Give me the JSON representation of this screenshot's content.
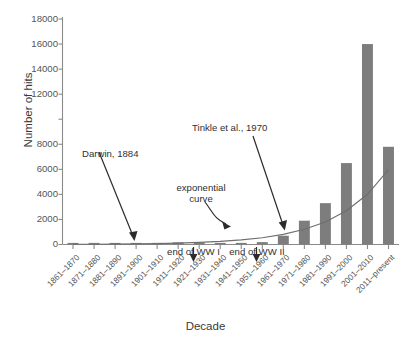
{
  "chart_data": {
    "type": "bar",
    "title": "",
    "subtitle": "",
    "xlabel": "Decade",
    "ylabel": "Number of hits",
    "ylim": [
      0,
      18000
    ],
    "ytick_labels": [
      "18000",
      "16000",
      "14000",
      "12000",
      "",
      "8000",
      "6000",
      "4000",
      "2000",
      "0"
    ],
    "ytick_values": [
      18000,
      16000,
      14000,
      12000,
      10000,
      8000,
      6000,
      4000,
      2000,
      0
    ],
    "grid": false,
    "legend": "none",
    "bar_color": "#7d7d7d",
    "curve_color": "#6e6e6e",
    "axis_color": "#8a8a8a",
    "categories": [
      "1861–1870",
      "1871–1880",
      "1881–1890",
      "1891–1900",
      "1901–1910",
      "1911–1920",
      "1921–1930",
      "1931–1940",
      "1941–1950",
      "1951–1960",
      "1961–1970",
      "1971–1980",
      "1981–1990",
      "1991–2000",
      "2001–2010",
      "2011–present"
    ],
    "values": [
      10,
      20,
      30,
      60,
      130,
      170,
      150,
      80,
      90,
      190,
      700,
      1900,
      3300,
      6500,
      16000,
      7800
    ],
    "series": [
      {
        "name": "Number of hits",
        "type": "bar",
        "values": [
          10,
          20,
          30,
          60,
          130,
          170,
          150,
          80,
          90,
          190,
          700,
          1900,
          3300,
          6500,
          16000,
          7800
        ]
      },
      {
        "name": "exponential curve",
        "type": "line",
        "values": [
          15,
          22,
          33,
          50,
          74,
          110,
          165,
          245,
          365,
          545,
          810,
          1210,
          1800,
          2690,
          4010,
          5980
        ]
      }
    ],
    "annotations": [
      {
        "id": "darwin",
        "text": "Darwin, 1884",
        "points_to_category": "1881–1890",
        "arrow": "straight"
      },
      {
        "id": "tinkle",
        "text": "Tinkle et al., 1970",
        "points_to_category": "1961–1970",
        "arrow": "straight"
      },
      {
        "id": "exponential",
        "text_line1": "exponential",
        "text_line2": "curve",
        "points_to": "trend-curve",
        "arrow": "curved"
      },
      {
        "id": "ww1",
        "text": "end of WW I",
        "points_to_category": "1911–1920",
        "arrow": "down"
      },
      {
        "id": "ww2",
        "text": "end of WW II",
        "points_to_category": "1941–1950",
        "arrow": "down"
      }
    ]
  }
}
